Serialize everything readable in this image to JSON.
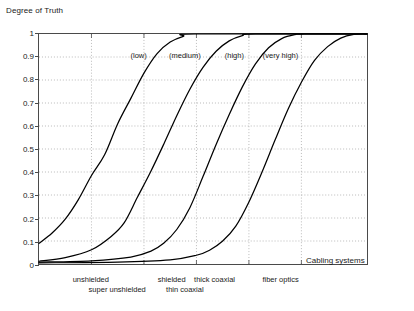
{
  "chart_data": {
    "type": "line",
    "title": "",
    "ylabel": "Degree of Truth",
    "xlabel": "Cabling systems",
    "ylim": [
      0,
      1
    ],
    "xlim": [
      0,
      10
    ],
    "grid": true,
    "legend_position": "inline-above-curves",
    "ytick_labels": [
      "0",
      "0.1",
      "0.2",
      "0.3",
      "0.4",
      "0.5",
      "0.6",
      "0.7",
      "0.8",
      "0.9",
      "1"
    ],
    "ytick_values": [
      0,
      0.1,
      0.2,
      0.3,
      0.4,
      0.5,
      0.6,
      0.7,
      0.8,
      0.9,
      1
    ],
    "xtick_values": [
      1.6,
      3.2,
      4.8,
      6.4,
      8.0
    ],
    "xtick_labels": [
      {
        "text": "unshielded",
        "x": 1.6,
        "row": 0
      },
      {
        "text": "super unshielded",
        "x": 2.4,
        "row": 1
      },
      {
        "text": "shielded",
        "x": 4.05,
        "row": 0
      },
      {
        "text": "thin coaxial",
        "x": 4.45,
        "row": 1
      },
      {
        "text": "thick coaxial",
        "x": 5.35,
        "row": 0
      },
      {
        "text": "fiber optics",
        "x": 7.35,
        "row": 0
      }
    ],
    "annotations": [
      {
        "text": "(low)",
        "x": 3.05,
        "y": 0.9
      },
      {
        "text": "(medium)",
        "x": 4.45,
        "y": 0.9
      },
      {
        "text": "(high)",
        "x": 5.95,
        "y": 0.9
      },
      {
        "text": "(very high)",
        "x": 7.35,
        "y": 0.9
      }
    ],
    "series": [
      {
        "name": "(low)",
        "midpoint": 2.15,
        "steepness": 1.25,
        "offset": 0.012,
        "points": [
          {
            "x": 0.0,
            "y": 0.09
          },
          {
            "x": 0.4,
            "y": 0.135
          },
          {
            "x": 0.8,
            "y": 0.195
          },
          {
            "x": 1.2,
            "y": 0.28
          },
          {
            "x": 1.6,
            "y": 0.385
          },
          {
            "x": 2.0,
            "y": 0.475
          },
          {
            "x": 2.4,
            "y": 0.61
          },
          {
            "x": 2.8,
            "y": 0.72
          },
          {
            "x": 3.2,
            "y": 0.83
          },
          {
            "x": 3.6,
            "y": 0.915
          },
          {
            "x": 4.0,
            "y": 0.965
          },
          {
            "x": 4.4,
            "y": 0.99
          },
          {
            "x": 4.8,
            "y": 1.0
          },
          {
            "x": 10.0,
            "y": 1.0
          }
        ]
      },
      {
        "name": "(medium)",
        "midpoint": 3.75,
        "steepness": 1.25,
        "offset": 0.008,
        "points": [
          {
            "x": 0.0,
            "y": 0.012
          },
          {
            "x": 0.8,
            "y": 0.028
          },
          {
            "x": 1.6,
            "y": 0.062
          },
          {
            "x": 2.2,
            "y": 0.12
          },
          {
            "x": 2.6,
            "y": 0.18
          },
          {
            "x": 3.0,
            "y": 0.29
          },
          {
            "x": 3.4,
            "y": 0.4
          },
          {
            "x": 3.8,
            "y": 0.52
          },
          {
            "x": 4.2,
            "y": 0.645
          },
          {
            "x": 4.6,
            "y": 0.76
          },
          {
            "x": 5.0,
            "y": 0.855
          },
          {
            "x": 5.4,
            "y": 0.925
          },
          {
            "x": 5.8,
            "y": 0.97
          },
          {
            "x": 6.2,
            "y": 0.993
          },
          {
            "x": 6.6,
            "y": 1.0
          },
          {
            "x": 10.0,
            "y": 1.0
          }
        ]
      },
      {
        "name": "(high)",
        "midpoint": 5.25,
        "steepness": 1.25,
        "offset": 0.006,
        "points": [
          {
            "x": 0.0,
            "y": 0.008
          },
          {
            "x": 1.6,
            "y": 0.014
          },
          {
            "x": 2.8,
            "y": 0.03
          },
          {
            "x": 3.4,
            "y": 0.055
          },
          {
            "x": 3.8,
            "y": 0.09
          },
          {
            "x": 4.2,
            "y": 0.15
          },
          {
            "x": 4.6,
            "y": 0.245
          },
          {
            "x": 5.0,
            "y": 0.38
          },
          {
            "x": 5.4,
            "y": 0.52
          },
          {
            "x": 5.8,
            "y": 0.65
          },
          {
            "x": 6.2,
            "y": 0.77
          },
          {
            "x": 6.6,
            "y": 0.87
          },
          {
            "x": 7.0,
            "y": 0.94
          },
          {
            "x": 7.4,
            "y": 0.98
          },
          {
            "x": 7.8,
            "y": 0.997
          },
          {
            "x": 8.1,
            "y": 1.0
          },
          {
            "x": 10.0,
            "y": 1.0
          }
        ]
      },
      {
        "name": "(very high)",
        "midpoint": 6.75,
        "steepness": 1.25,
        "offset": 0.004,
        "points": [
          {
            "x": 0.0,
            "y": 0.005
          },
          {
            "x": 2.4,
            "y": 0.008
          },
          {
            "x": 4.0,
            "y": 0.018
          },
          {
            "x": 4.8,
            "y": 0.038
          },
          {
            "x": 5.2,
            "y": 0.06
          },
          {
            "x": 5.6,
            "y": 0.1
          },
          {
            "x": 6.0,
            "y": 0.165
          },
          {
            "x": 6.4,
            "y": 0.27
          },
          {
            "x": 6.8,
            "y": 0.4
          },
          {
            "x": 7.2,
            "y": 0.54
          },
          {
            "x": 7.6,
            "y": 0.675
          },
          {
            "x": 8.0,
            "y": 0.79
          },
          {
            "x": 8.4,
            "y": 0.885
          },
          {
            "x": 8.8,
            "y": 0.945
          },
          {
            "x": 9.2,
            "y": 0.982
          },
          {
            "x": 9.6,
            "y": 0.998
          },
          {
            "x": 10.0,
            "y": 1.0
          }
        ]
      }
    ]
  },
  "colors": {
    "curve": "#000000",
    "grid": "#9b9b9b",
    "axis": "#4a4a4a",
    "text": "#1a1a1a",
    "background": "#ffffff"
  }
}
